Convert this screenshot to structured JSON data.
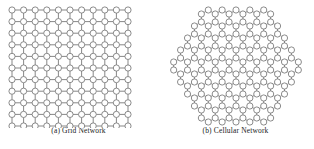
{
  "figure": {
    "background_color": "#ffffff",
    "stroke_color": "#555555",
    "node_fill": "#ffffff",
    "node_stroke": "#666666",
    "caption_color": "#1a1a1a",
    "panels": [
      {
        "id": "grid-network",
        "caption": "(a) Grid Network",
        "topology": "grid",
        "rows": 11,
        "cols": 11,
        "node_radius": 3.1,
        "spacing": 11.6,
        "origin_x": 12,
        "origin_y": 10
      },
      {
        "id": "cellular-network",
        "caption": "(b) Cellular Network",
        "topology": "honeycomb",
        "hex_rings": 4,
        "node_radius": 3.1,
        "bond_length": 8.0,
        "center_x": 79,
        "center_y": 66
      }
    ]
  },
  "chart_data": {
    "type": "diagram",
    "title": "",
    "subtitle": "",
    "panels": [
      {
        "label": "(a) Grid Network",
        "network_type": "grid",
        "node_count": 121,
        "grid_rows": 11,
        "grid_columns": 11,
        "edge_pattern": "4-neighbor orthogonal lattice"
      },
      {
        "label": "(b) Cellular Network",
        "network_type": "honeycomb / hexagonal cellular",
        "hex_rings": 4,
        "edge_pattern": "3-neighbor honeycomb lattice, hexagonal boundary"
      }
    ]
  }
}
